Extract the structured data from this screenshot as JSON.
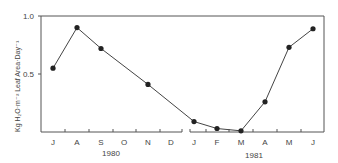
{
  "chart_data": {
    "type": "line",
    "title": "",
    "xlabel": "",
    "ylabel": "Kg H₂O·m⁻² Leaf Area·Day⁻¹",
    "ylim": [
      0,
      1.0
    ],
    "yticks": [
      {
        "value": 0.5,
        "label": "0.5"
      },
      {
        "value": 1.0,
        "label": "1.0"
      }
    ],
    "grid": false,
    "legend": null,
    "x_groups": [
      {
        "year": "1980",
        "months": [
          "J",
          "A",
          "S",
          "O",
          "N",
          "D"
        ]
      },
      {
        "year": "1981",
        "months": [
          "J",
          "F",
          "M",
          "A",
          "M",
          "J"
        ]
      }
    ],
    "categories": [
      "J 1980",
      "A 1980",
      "S 1980",
      "O 1980",
      "N 1980",
      "D 1980",
      "J 1981",
      "F 1981",
      "M 1981",
      "A 1981",
      "M 1981",
      "J 1981"
    ],
    "series": [
      {
        "name": "Water use",
        "points": [
          {
            "x": "J 1980",
            "y": 0.55
          },
          {
            "x": "A 1980",
            "y": 0.9
          },
          {
            "x": "S 1980",
            "y": 0.72
          },
          {
            "x": "N 1980",
            "y": 0.41
          },
          {
            "x": "J 1981",
            "y": 0.09
          },
          {
            "x": "F 1981",
            "y": 0.03
          },
          {
            "x": "M 1981",
            "y": 0.01
          },
          {
            "x": "A 1981",
            "y": 0.26
          },
          {
            "x": "M 1981",
            "y": 0.73
          },
          {
            "x": "J 1981",
            "y": 0.89
          }
        ]
      }
    ],
    "annotations": [
      "x-axis break between D 1980 and J 1981"
    ]
  },
  "axis": {
    "y_tick_1": "1.0",
    "y_tick_05": "0.5",
    "year_1980": "1980",
    "year_1981": "1981"
  },
  "colors": {
    "line": "#444444",
    "marker": "#222222",
    "axis": "#555555"
  }
}
